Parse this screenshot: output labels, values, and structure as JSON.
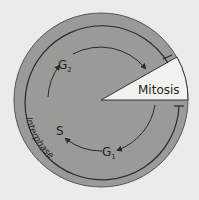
{
  "diagram": {
    "labels": {
      "mitosis": "Mitosis",
      "g2": "G",
      "g2_sub": "2",
      "s": "S",
      "g1": "G",
      "g1_sub": "1",
      "interphase": "Interphase"
    },
    "colors": {
      "background": "#ebebea",
      "circle_fill": "#9a9a98",
      "wedge_fill": "#f2f2f0",
      "line": "#2a2a2a"
    }
  }
}
